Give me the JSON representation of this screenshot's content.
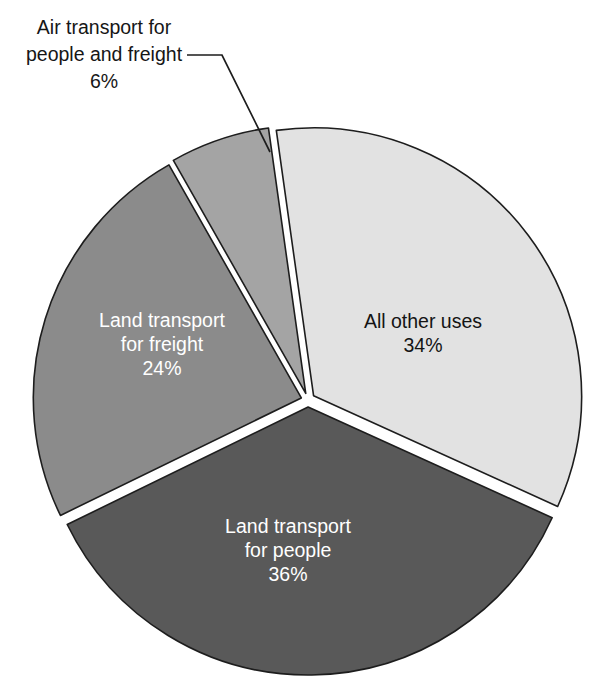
{
  "chart_data": {
    "type": "pie",
    "title": "",
    "subtitle": "",
    "xlabel": "",
    "ylabel": "",
    "legend_position": "none",
    "grid": false,
    "units": "%",
    "total": 100,
    "center": {
      "x": 308,
      "y": 400
    },
    "radius": 268,
    "exploded": true,
    "categories": [
      "All other uses",
      "Land transport for people",
      "Land transport for freight",
      "Air transport for people and freight"
    ],
    "values": [
      34,
      36,
      24,
      6
    ],
    "slices": [
      {
        "key": "all-other-uses",
        "label": "All other uses",
        "value": 34,
        "value_text": "34%",
        "label_lines": [
          "All other uses",
          "34%"
        ],
        "color": "#e2e2e2",
        "text_color": "#141414",
        "label_placement": "inside",
        "label_x": 423,
        "label_y": 323,
        "start_angle": -8,
        "end_angle": 114.4,
        "offset_angle": 53.2,
        "offset_distance": 7
      },
      {
        "key": "land-transport-people",
        "label": "Land transport for people",
        "value": 36,
        "value_text": "36%",
        "label_lines": [
          "Land transport",
          "for people",
          "36%"
        ],
        "color": "#595959",
        "text_color": "#ffffff",
        "label_placement": "inside",
        "label_x": 288,
        "label_y": 528,
        "start_angle": 114.4,
        "end_angle": 244,
        "offset_angle": 179.2,
        "offset_distance": 7
      },
      {
        "key": "land-transport-freight",
        "label": "Land transport for freight",
        "value": 24,
        "value_text": "24%",
        "label_lines": [
          "Land transport",
          "for freight",
          "24%"
        ],
        "color": "#8b8b8b",
        "text_color": "#ffffff",
        "label_placement": "inside",
        "label_x": 162,
        "label_y": 322,
        "start_angle": 244,
        "end_angle": 330.4,
        "offset_angle": 287.2,
        "offset_distance": 7
      },
      {
        "key": "air-transport",
        "label": "Air transport for people and freight",
        "value": 6,
        "value_text": "6%",
        "label_lines": [
          "Air transport for",
          "people and freight",
          "6%"
        ],
        "color": "#a4a4a4",
        "text_color": "#141414",
        "label_placement": "callout",
        "label_x": 104,
        "label_y": 34,
        "start_angle": 330.4,
        "end_angle": 352,
        "offset_angle": 341.2,
        "offset_distance": 7
      }
    ],
    "callout": {
      "text_lines": [
        "Air transport for",
        "people and freight",
        "6%"
      ],
      "anchor_x": 104,
      "anchor_y": 34,
      "line_points": "187,55 222,55 270,152",
      "line_color": "#1d1d1d"
    },
    "colors": {
      "all_other_uses": "#e2e2e2",
      "land_transport_people": "#595959",
      "land_transport_freight": "#8b8b8b",
      "air_transport": "#a4a4a4",
      "outline": "#1d1d1d",
      "background": "#ffffff"
    }
  }
}
